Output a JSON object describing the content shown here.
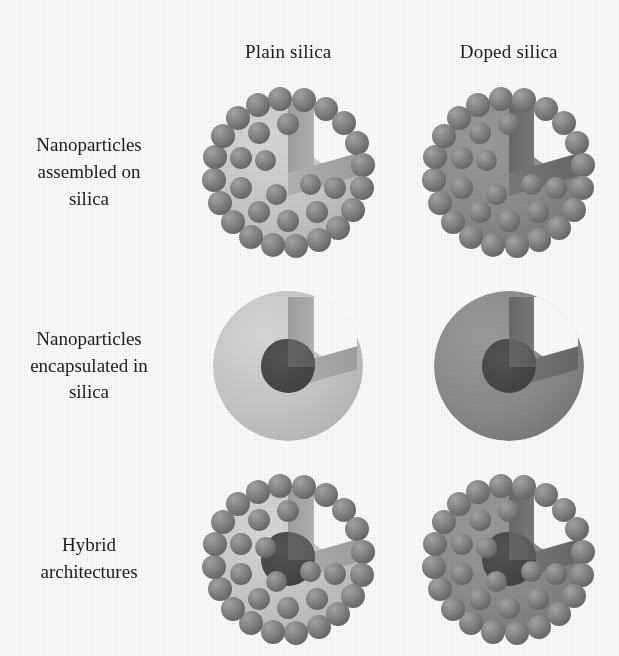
{
  "figure": {
    "background": "#ffffff",
    "text_color": "#1c1c1c"
  },
  "columns": [
    {
      "id": "plain",
      "label": "Plain silica"
    },
    {
      "id": "doped",
      "label": "Doped silica"
    }
  ],
  "rows": [
    {
      "id": "assembled",
      "label_lines": [
        "Nanoparticles",
        "assembled on",
        "silica"
      ],
      "line1": "Nanoparticles",
      "line2": "assembled on",
      "line3": "silica"
    },
    {
      "id": "encapsulated",
      "label_lines": [
        "Nanoparticles",
        "encapsulated in",
        "silica"
      ],
      "line1": "Nanoparticles",
      "line2": "encapsulated in",
      "line3": "silica"
    },
    {
      "id": "hybrid",
      "label_lines": [
        "Hybrid",
        "architectures"
      ],
      "line1": "Hybrid",
      "line2": "architectures",
      "line3": ""
    }
  ],
  "palette": {
    "plain_silica": "#c9c9c9",
    "plain_silica_light": "#dcdcdc",
    "plain_silica_dark": "#b0b0b0",
    "plain_wedge_face": "#b6b6b6",
    "plain_wedge_face_dark": "#a2a2a2",
    "doped_silica": "#8d8d8d",
    "doped_silica_light": "#9e9e9e",
    "doped_silica_dark": "#6f6f6f",
    "doped_wedge_face": "#7c7c7c",
    "doped_wedge_face_dark": "#6a6a6a",
    "bead": "#7b7b7b",
    "bead_highlight": "#a8a8a8",
    "bead_shadow": "#555555",
    "core": "#565656",
    "core_dark": "#444444",
    "paper": "#ffffff",
    "text": "#1c1c1c"
  },
  "cells": [
    {
      "id": "assembled-plain",
      "row": "assembled",
      "column": "plain",
      "description": "Light silica sphere with cut-away wedge, densely covered by darker nanoparticle beads on its surface",
      "has_beads": true,
      "has_core": false,
      "bead_count": 34,
      "sphere_tone": "plain"
    },
    {
      "id": "assembled-doped",
      "row": "assembled",
      "column": "doped",
      "description": "Dark doped silica sphere with cut-away wedge, densely covered by nanoparticle beads on its surface",
      "has_beads": true,
      "has_core": false,
      "bead_count": 34,
      "sphere_tone": "doped"
    },
    {
      "id": "encapsulated-plain",
      "row": "encapsulated",
      "column": "plain",
      "description": "Very light silica sphere, cut-away wedge revealing a single dark nanoparticle core inside",
      "has_beads": false,
      "has_core": true,
      "bead_count": 0,
      "sphere_tone": "plain"
    },
    {
      "id": "encapsulated-doped",
      "row": "encapsulated",
      "column": "doped",
      "description": "Dark doped silica sphere, cut-away wedge revealing a single darker nanoparticle core inside",
      "has_beads": false,
      "has_core": true,
      "bead_count": 0,
      "sphere_tone": "doped"
    },
    {
      "id": "hybrid-plain",
      "row": "hybrid",
      "column": "plain",
      "description": "Light silica sphere with both an encapsulated dark core and surface nanoparticle beads",
      "has_beads": true,
      "has_core": true,
      "bead_count": 34,
      "sphere_tone": "plain"
    },
    {
      "id": "hybrid-doped",
      "row": "hybrid",
      "column": "doped",
      "description": "Dark doped silica sphere with both an encapsulated dark core and surface nanoparticle beads",
      "has_beads": true,
      "has_core": true,
      "bead_count": 34,
      "sphere_tone": "doped"
    }
  ],
  "bead_layout": {
    "rings": [
      {
        "radius_pct": 50.0,
        "count": 20,
        "start_deg": -96,
        "size": 24
      },
      {
        "radius_pct": 33.0,
        "count": 10,
        "start_deg": -54,
        "size": 22
      },
      {
        "radius_pct": 17.0,
        "count": 4,
        "start_deg": 28,
        "size": 21
      }
    ]
  }
}
